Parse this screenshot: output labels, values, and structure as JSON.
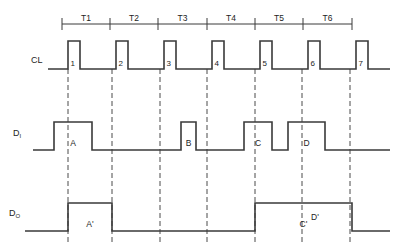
{
  "diagram": {
    "type": "timing-waveform",
    "stroke_color": "#3a3a3a",
    "dash_color": "#4a4a4a",
    "background": "#ffffff",
    "periods": [
      {
        "label": "T1",
        "start_x": 62,
        "end_x": 110
      },
      {
        "label": "T2",
        "start_x": 110,
        "end_x": 158
      },
      {
        "label": "T3",
        "start_x": 158,
        "end_x": 207
      },
      {
        "label": "T4",
        "start_x": 207,
        "end_x": 255
      },
      {
        "label": "T5",
        "start_x": 255,
        "end_x": 303
      },
      {
        "label": "T6",
        "start_x": 303,
        "end_x": 352
      }
    ],
    "signals": [
      {
        "name": "CL",
        "label": "CL",
        "subscript": "",
        "label_x": 31,
        "label_y": 63,
        "high_y": 41,
        "low_y": 69,
        "pulse_labels": [
          "1",
          "2",
          "3",
          "4",
          "5",
          "6",
          "7"
        ],
        "pulses": [
          {
            "rise": 68,
            "fall": 80
          },
          {
            "rise": 116,
            "fall": 128
          },
          {
            "rise": 164,
            "fall": 176
          },
          {
            "rise": 212,
            "fall": 224
          },
          {
            "rise": 260,
            "fall": 272
          },
          {
            "rise": 308,
            "fall": 320
          },
          {
            "rise": 356,
            "fall": 368
          }
        ],
        "start_x": 48,
        "end_x": 390
      },
      {
        "name": "DI",
        "label": "D",
        "subscript": "I",
        "label_x": 13,
        "label_y": 136,
        "high_y": 122,
        "low_y": 150,
        "pulse_labels": [
          "A",
          "B",
          "C",
          "D"
        ],
        "pulses": [
          {
            "rise": 54,
            "fall": 92
          },
          {
            "rise": 181,
            "fall": 196
          },
          {
            "rise": 244,
            "fall": 272
          },
          {
            "rise": 288,
            "fall": 325
          }
        ],
        "start_x": 33,
        "end_x": 390
      },
      {
        "name": "DO",
        "label": "D",
        "subscript": "O",
        "label_x": 9,
        "label_y": 216,
        "high_y": 203,
        "low_y": 231,
        "pulse_labels": [
          "A'",
          "C'"
        ],
        "pulses": [
          {
            "rise": 68,
            "fall": 112
          },
          {
            "rise": 255,
            "fall": 352
          }
        ],
        "extra_labels": [
          {
            "text": "D'",
            "x": 315,
            "y": 220
          }
        ],
        "start_x": 25,
        "end_x": 390
      }
    ],
    "dashed_lines": [
      {
        "x": 68,
        "y1": 69,
        "y2": 242
      },
      {
        "x": 112,
        "y1": 69,
        "y2": 242
      },
      {
        "x": 160,
        "y1": 69,
        "y2": 242
      },
      {
        "x": 207,
        "y1": 69,
        "y2": 242
      },
      {
        "x": 255,
        "y1": 69,
        "y2": 242
      },
      {
        "x": 302,
        "y1": 69,
        "y2": 242
      },
      {
        "x": 350,
        "y1": 69,
        "y2": 242
      }
    ],
    "tick_axis": {
      "y": 24,
      "tick_top": 18,
      "tick_bottom": 30,
      "x_start": 62,
      "x_end": 352,
      "ticks": [
        62,
        110,
        158,
        207,
        255,
        303,
        352
      ]
    }
  }
}
